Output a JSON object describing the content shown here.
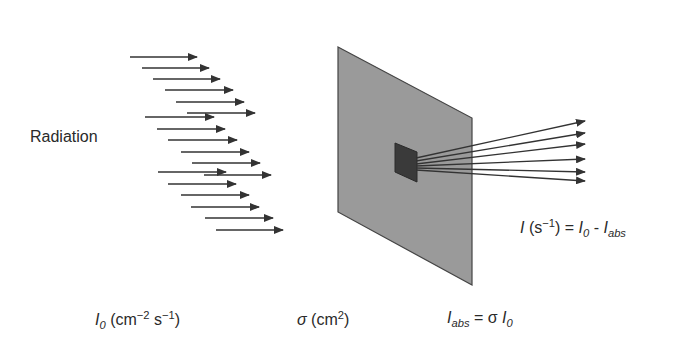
{
  "labels": {
    "radiation": "Radiation",
    "flux": {
      "symbol": "I",
      "sub": "0",
      "unit_open": " (cm",
      "unit_exp1": "−2",
      "unit_mid": " s",
      "unit_exp2": "−1",
      "unit_close": ")"
    },
    "cross_section": {
      "symbol": "σ",
      "unit_open": " (cm",
      "unit_exp": "2",
      "unit_close": ")"
    },
    "absorbed": {
      "symbol": "I",
      "sub": "abs",
      "eq": " = σ ",
      "symbol2": "I",
      "sub2": "0"
    },
    "transmitted": {
      "symbol": "I",
      "unit_open": " (s",
      "unit_exp": "−1",
      "unit_close": ") = ",
      "symbol2": "I",
      "sub2": "0",
      "minus": " - ",
      "symbol3": "I",
      "sub3": "abs"
    }
  },
  "colors": {
    "panel": "#9a9a9a",
    "panel_edge": "#444444",
    "absorber": "#3a3a3a",
    "arrow": "#333333"
  },
  "incoming_arrows": [
    {
      "x1": 130,
      "x2": 197,
      "y": 57
    },
    {
      "x1": 142,
      "x2": 209,
      "y": 68
    },
    {
      "x1": 153,
      "x2": 220,
      "y": 79
    },
    {
      "x1": 165,
      "x2": 233,
      "y": 90
    },
    {
      "x1": 176,
      "x2": 244,
      "y": 102
    },
    {
      "x1": 187,
      "x2": 255,
      "y": 113
    },
    {
      "x1": 145,
      "x2": 214,
      "y": 117
    },
    {
      "x1": 157,
      "x2": 225,
      "y": 129
    },
    {
      "x1": 168,
      "x2": 237,
      "y": 140
    },
    {
      "x1": 181,
      "x2": 249,
      "y": 152
    },
    {
      "x1": 192,
      "x2": 260,
      "y": 163
    },
    {
      "x1": 158,
      "x2": 226,
      "y": 172
    },
    {
      "x1": 204,
      "x2": 271,
      "y": 175
    },
    {
      "x1": 168,
      "x2": 236,
      "y": 184
    },
    {
      "x1": 181,
      "x2": 249,
      "y": 195
    },
    {
      "x1": 191,
      "x2": 259,
      "y": 207
    },
    {
      "x1": 205,
      "x2": 273,
      "y": 218
    },
    {
      "x1": 216,
      "x2": 283,
      "y": 230
    }
  ],
  "outgoing_rays": [
    {
      "y1": 158,
      "y2": 121
    },
    {
      "y1": 161,
      "y2": 133
    },
    {
      "y1": 164,
      "y2": 144
    },
    {
      "y1": 166,
      "y2": 159
    },
    {
      "y1": 168,
      "y2": 172
    },
    {
      "y1": 170,
      "y2": 181
    }
  ]
}
